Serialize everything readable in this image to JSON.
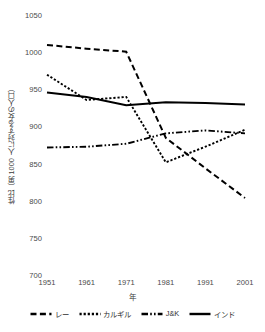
{
  "chart_data": {
    "type": "line",
    "title": "",
    "xlabel": "年",
    "ylabel": "性比（男 1000 人に対する女の人口）",
    "x": [
      1951,
      1961,
      1971,
      1981,
      1991,
      2001
    ],
    "xticklabels": [
      "1951",
      "1961",
      "1971",
      "1981",
      "1991",
      "2001"
    ],
    "yticklabels": [
      "700",
      "750",
      "800",
      "850",
      "900",
      "950",
      "1000",
      "1050"
    ],
    "yticks": [
      700,
      750,
      800,
      850,
      900,
      950,
      1000,
      1050
    ],
    "ylim": [
      700,
      1050
    ],
    "xlim": [
      1951,
      2001
    ],
    "grid": false,
    "legend_position": "bottom",
    "series": [
      {
        "name": "レー",
        "style": "dashed",
        "color": "#000000",
        "values": [
          1011,
          1006,
          1002,
          886,
          845,
          805
        ]
      },
      {
        "name": "カルギル",
        "style": "dotted",
        "color": "#000000",
        "values": [
          971,
          937,
          941,
          853,
          874,
          897
        ]
      },
      {
        "name": "J&K",
        "style": "dashdot",
        "color": "#000000",
        "values": [
          873,
          874,
          878,
          892,
          896,
          892
        ]
      },
      {
        "name": "インド",
        "style": "solid",
        "color": "#000000",
        "values": [
          947,
          941,
          930,
          934,
          933,
          931
        ]
      }
    ]
  }
}
